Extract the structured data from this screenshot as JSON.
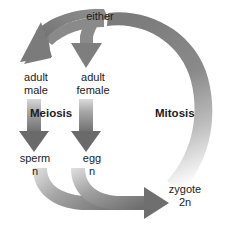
{
  "diagram": {
    "background_color": "#ffffff",
    "text_color": "#1b1b1b",
    "arrow_color_dark": "#6f6f6f",
    "arrow_color_mid": "#8e8e8e",
    "arrow_color_light": "#d8d8d8",
    "labels": {
      "either": "either",
      "adult_male": "adult\nmale",
      "adult_female": "adult\nfemale",
      "meiosis": "Meiosis",
      "mitosis": "Mitosis",
      "sperm": "sperm\nn",
      "egg": "egg\nn",
      "zygote": "zygote\n2n"
    },
    "arrows": [
      {
        "name": "either-to-adult-male",
        "from": "either",
        "to": "adult male",
        "style": "curved",
        "shaded": true
      },
      {
        "name": "either-to-adult-female",
        "from": "either",
        "to": "adult female",
        "style": "curved",
        "shaded": true
      },
      {
        "name": "meiosis-male",
        "from": "adult male",
        "to": "sperm",
        "style": "straight-down",
        "process": "Meiosis",
        "gradient": "light-to-dark"
      },
      {
        "name": "meiosis-female",
        "from": "adult female",
        "to": "egg",
        "style": "straight-down",
        "process": "Meiosis",
        "gradient": "light-to-dark"
      },
      {
        "name": "fertilization-sperm",
        "from": "sperm",
        "to": "zygote",
        "style": "curved-merge",
        "gradient": "light-to-dark"
      },
      {
        "name": "fertilization-egg",
        "from": "egg",
        "to": "zygote",
        "style": "curved-merge",
        "gradient": "light-to-dark"
      },
      {
        "name": "mitosis-arc",
        "from": "zygote",
        "to": "either",
        "style": "large-arc",
        "process": "Mitosis",
        "gradient": "fade-to-white"
      }
    ]
  }
}
